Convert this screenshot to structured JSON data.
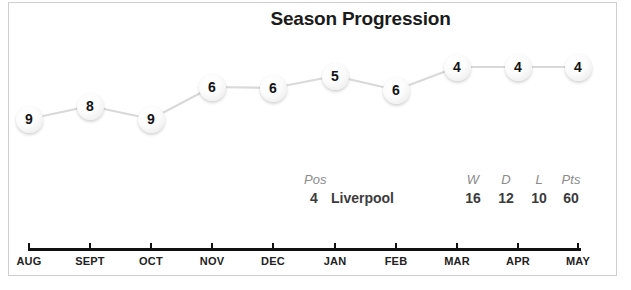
{
  "chart_data": {
    "type": "line",
    "title": "Season Progression",
    "xlabel": "",
    "ylabel": "League Position",
    "grid": false,
    "legend": "none",
    "ylim": [
      10,
      1
    ],
    "y_axis_inverted": true,
    "categories": [
      "AUG",
      "SEPT",
      "OCT",
      "NOV",
      "DEC",
      "JAN",
      "FEB",
      "MAR",
      "APR",
      "MAY"
    ],
    "values": [
      9,
      8,
      9,
      6,
      6,
      5,
      6,
      4,
      4,
      4
    ],
    "series": [
      {
        "name": "Liverpool league position",
        "values": [
          9,
          8,
          9,
          6,
          6,
          5,
          6,
          4,
          4,
          4
        ]
      }
    ],
    "points": [
      {
        "x": "AUG",
        "label": "9",
        "cx": 29,
        "cy": 119
      },
      {
        "x": "SEPT",
        "label": "8",
        "cx": 90,
        "cy": 106
      },
      {
        "x": "OCT",
        "label": "9",
        "cx": 151,
        "cy": 119
      },
      {
        "x": "NOV",
        "label": "6",
        "cx": 212,
        "cy": 87
      },
      {
        "x": "DEC",
        "label": "6",
        "cx": 273,
        "cy": 88
      },
      {
        "x": "JAN",
        "label": "5",
        "cx": 335,
        "cy": 76
      },
      {
        "x": "FEB",
        "label": "6",
        "cx": 396,
        "cy": 90
      },
      {
        "x": "MAR",
        "label": "4",
        "cx": 457,
        "cy": 67
      },
      {
        "x": "APR",
        "label": "4",
        "cx": 518,
        "cy": 67
      },
      {
        "x": "MAY",
        "label": "4",
        "cx": 578,
        "cy": 67
      }
    ],
    "ticks": [
      {
        "label": "AUG",
        "x": 29
      },
      {
        "label": "SEPT",
        "x": 90
      },
      {
        "label": "OCT",
        "x": 151
      },
      {
        "label": "NOV",
        "x": 212
      },
      {
        "label": "DEC",
        "x": 273
      },
      {
        "label": "JAN",
        "x": 335
      },
      {
        "label": "FEB",
        "x": 396
      },
      {
        "label": "MAR",
        "x": 457
      },
      {
        "label": "APR",
        "x": 518
      },
      {
        "label": "MAY",
        "x": 578
      }
    ]
  },
  "summary": {
    "pos_header": "Pos",
    "pos_value": "4",
    "team_name": "Liverpool",
    "stats": [
      {
        "header": "W",
        "value": "16"
      },
      {
        "header": "D",
        "value": "12"
      },
      {
        "header": "L",
        "value": "10"
      },
      {
        "header": "Pts",
        "value": "60"
      }
    ]
  },
  "colors": {
    "node_fill": "#f4f4f4",
    "node_text": "#141414",
    "line": "#d9d9d9",
    "axis": "#111111",
    "title": "#1b1b1b",
    "header_text": "#8b8b8b",
    "value_text": "#3c3c3c",
    "frame": "#cfcfcf",
    "background": "#ffffff"
  }
}
